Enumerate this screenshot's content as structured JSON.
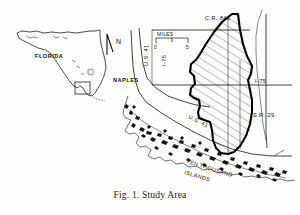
{
  "figure": {
    "caption": "Fig. 1. Study Area",
    "caption_number": "Fig. 1.",
    "caption_title": "Study Area"
  },
  "inset": {
    "name": "florida-state-inset",
    "label": "FLORIDA",
    "locator_box": "study area locator box"
  },
  "compass": {
    "label": "N",
    "name": "north-arrow"
  },
  "scale_bar": {
    "title": "MILES",
    "ticks": [
      "0",
      "5"
    ],
    "min": "0",
    "max": "5",
    "units": "MILES"
  },
  "map_labels": {
    "city": "NAPLES",
    "county_road": "C.R. 846",
    "interstate_vertical": "I-75",
    "interstate_right": "I-75",
    "us_highway_vertical": "U.S. 41",
    "us_highway_diagonal": "U.S. 41",
    "state_road": "S.R. 29",
    "islands_line1": "TEN",
    "islands_line2": "THOUSAND",
    "islands_line3": "ISLANDS",
    "islands_full": "TEN THOUSAND ISLANDS"
  },
  "study_area": {
    "name": "study-area-polygon",
    "fill_pattern": "diagonal-hatch",
    "outline_color": "#000000"
  },
  "colors": {
    "background": "#fdfdfc",
    "ink": "#111111",
    "caption": "#1a1a1a"
  }
}
